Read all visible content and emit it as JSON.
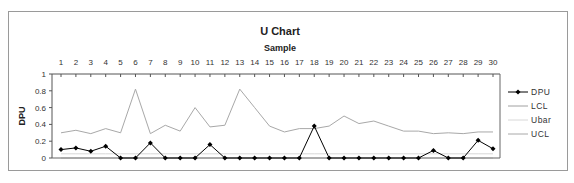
{
  "chart_data": {
    "type": "line",
    "title": "U Chart",
    "xlabel": "Sample",
    "ylabel": "DPU",
    "x": [
      1,
      2,
      3,
      4,
      5,
      6,
      7,
      8,
      9,
      10,
      11,
      12,
      13,
      14,
      15,
      16,
      17,
      18,
      19,
      20,
      21,
      22,
      23,
      24,
      25,
      26,
      27,
      28,
      29,
      30
    ],
    "yticks": [
      "0",
      "0.2",
      "0.4",
      "0.6",
      "0.8",
      "1"
    ],
    "ylim": [
      0,
      1
    ],
    "xaxis_position": "top",
    "grid": false,
    "legend_position": "right",
    "series": [
      {
        "name": "DPU",
        "color": "#000000",
        "marker": "diamond",
        "values": [
          0.1,
          0.12,
          0.08,
          0.14,
          0,
          0,
          0.18,
          0,
          0,
          0,
          0.16,
          0,
          0,
          0,
          0,
          0,
          0,
          0.38,
          0,
          0,
          0,
          0,
          0,
          0,
          0,
          0.09,
          0,
          0,
          0.21,
          0.11
        ]
      },
      {
        "name": "LCL",
        "color": "#a0a0a0",
        "values": [
          0,
          0,
          0,
          0,
          0,
          0,
          0,
          0,
          0,
          0,
          0,
          0,
          0,
          0,
          0,
          0,
          0,
          0,
          0,
          0,
          0,
          0,
          0,
          0,
          0,
          0,
          0,
          0,
          0,
          0
        ]
      },
      {
        "name": "Ubar",
        "color": "#d8d8d8",
        "values": [
          0.05,
          0.05,
          0.05,
          0.05,
          0.05,
          0.05,
          0.05,
          0.05,
          0.05,
          0.05,
          0.05,
          0.05,
          0.05,
          0.05,
          0.05,
          0.05,
          0.05,
          0.05,
          0.05,
          0.05,
          0.05,
          0.05,
          0.05,
          0.05,
          0.05,
          0.05,
          0.05,
          0.05,
          0.05,
          0.05
        ]
      },
      {
        "name": "UCL",
        "color": "#a8a8a8",
        "values": [
          0.3,
          0.33,
          0.29,
          0.35,
          0.3,
          0.82,
          0.29,
          0.39,
          0.32,
          0.6,
          0.37,
          0.39,
          0.82,
          0.6,
          0.38,
          0.31,
          0.35,
          0.35,
          0.38,
          0.5,
          0.41,
          0.44,
          0.38,
          0.32,
          0.32,
          0.29,
          0.3,
          0.29,
          0.31,
          0.31
        ]
      }
    ]
  }
}
